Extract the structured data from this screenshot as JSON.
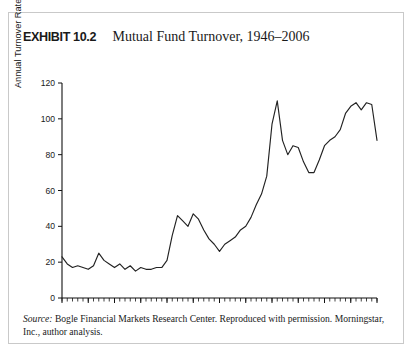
{
  "figure": {
    "exhibit_label": "EXHIBIT 10.2",
    "title": "Mutual Fund Turnover, 1946–2006",
    "source_prefix": "Source:",
    "source_text": "Bogle Financial Markets Research Center. Reproduced with permission. Morningstar, Inc., author analysis."
  },
  "chart_data": {
    "type": "line",
    "title": "Mutual Fund Turnover, 1946–2006",
    "xlabel": "",
    "ylabel": "Annual Turnover Rate (%)",
    "xlim": [
      1946,
      2006
    ],
    "ylim": [
      0,
      120
    ],
    "yticks": [
      0,
      20,
      40,
      60,
      80,
      100,
      120
    ],
    "xticks": [
      1946,
      1951,
      1956,
      1961,
      1966,
      1971,
      1976,
      1981,
      1986,
      1991,
      1996,
      2001,
      2006
    ],
    "grid": false,
    "legend": null,
    "x": [
      1946,
      1947,
      1948,
      1949,
      1950,
      1951,
      1952,
      1953,
      1954,
      1955,
      1956,
      1957,
      1958,
      1959,
      1960,
      1961,
      1962,
      1963,
      1964,
      1965,
      1966,
      1967,
      1968,
      1969,
      1970,
      1971,
      1972,
      1973,
      1974,
      1975,
      1976,
      1977,
      1978,
      1979,
      1980,
      1981,
      1982,
      1983,
      1984,
      1985,
      1986,
      1987,
      1988,
      1989,
      1990,
      1991,
      1992,
      1993,
      1994,
      1995,
      1996,
      1997,
      1998,
      1999,
      2000,
      2001,
      2002,
      2003,
      2004,
      2005,
      2006
    ],
    "values": [
      23,
      19,
      17,
      18,
      17,
      16,
      18,
      25,
      21,
      19,
      17,
      19,
      16,
      18,
      15,
      17,
      16,
      16,
      17,
      17,
      21,
      35,
      46,
      43,
      40,
      47,
      44,
      38,
      33,
      30,
      26,
      30,
      32,
      34,
      38,
      40,
      45,
      52,
      58,
      68,
      97,
      110,
      88,
      80,
      85,
      84,
      76,
      70,
      70,
      77,
      85,
      88,
      90,
      94,
      103,
      107,
      109,
      105,
      109,
      108,
      88
    ],
    "series": [
      {
        "name": "Annual Turnover Rate (%)",
        "values": [
          23,
          19,
          17,
          18,
          17,
          16,
          18,
          25,
          21,
          19,
          17,
          19,
          16,
          18,
          15,
          17,
          16,
          16,
          17,
          17,
          21,
          35,
          46,
          43,
          40,
          47,
          44,
          38,
          33,
          30,
          26,
          30,
          32,
          34,
          38,
          40,
          45,
          52,
          58,
          68,
          97,
          110,
          88,
          80,
          85,
          84,
          76,
          70,
          70,
          77,
          85,
          88,
          90,
          94,
          103,
          107,
          109,
          105,
          109,
          108,
          88
        ]
      }
    ]
  }
}
